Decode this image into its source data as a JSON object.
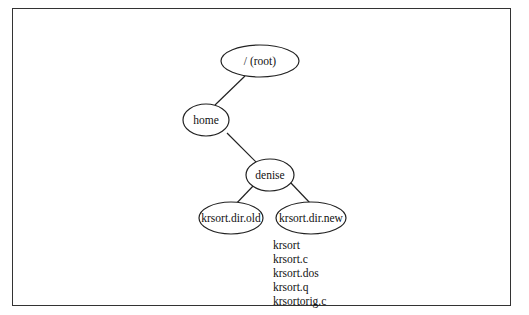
{
  "diagram": {
    "type": "directory-tree",
    "nodes": [
      {
        "id": "root",
        "label": "/ (root)"
      },
      {
        "id": "home",
        "label": "home"
      },
      {
        "id": "denise",
        "label": "denise"
      },
      {
        "id": "old",
        "label": "krsort.dir.old"
      },
      {
        "id": "new",
        "label": "krsort.dir.new"
      }
    ],
    "edges": [
      {
        "from": "root",
        "to": "home"
      },
      {
        "from": "home",
        "to": "denise"
      },
      {
        "from": "denise",
        "to": "old"
      },
      {
        "from": "denise",
        "to": "new"
      }
    ],
    "files_in_new": [
      "krsort",
      "krsort.c",
      "krsort.dos",
      "krsort.q",
      "krsortorig.c"
    ]
  }
}
